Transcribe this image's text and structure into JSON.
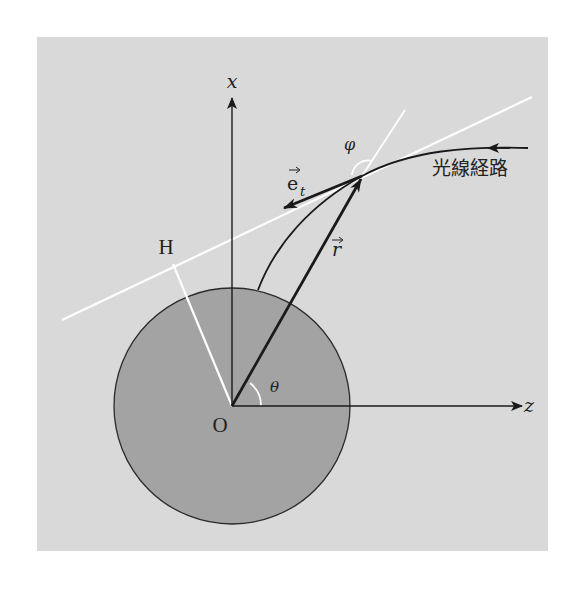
{
  "diagram": {
    "title": "",
    "colors": {
      "panel_background": "#d9d9d9",
      "sphere_fill": "#a3a3a3",
      "ink": "#1a1a1a",
      "construction_lines": "#ffffff"
    },
    "labels": {
      "x_axis": "x",
      "z_axis": "z",
      "origin": "O",
      "foot_point": "H",
      "tangent_vector": "e",
      "tangent_vector_subscript": "t",
      "position_vector": "r",
      "polar_angle": "θ",
      "angle_phi": "φ",
      "light_path": "光線経路"
    },
    "elements": [
      {
        "id": "sphere",
        "type": "circle",
        "description": "gray body centered at O"
      },
      {
        "id": "x-axis",
        "type": "arrow",
        "from": "O",
        "direction": "up"
      },
      {
        "id": "z-axis",
        "type": "arrow",
        "from": "O",
        "direction": "right"
      },
      {
        "id": "light-ray",
        "type": "curve",
        "description": "incoming from right, bending toward sphere"
      },
      {
        "id": "tangent-line",
        "type": "line",
        "color": "white",
        "description": "tangent to ray at point P"
      },
      {
        "id": "perpendicular-OH",
        "type": "line",
        "color": "white",
        "description": "from O perpendicular to tangent line at H"
      },
      {
        "id": "radial-extension",
        "type": "line",
        "color": "white",
        "description": "extension of r beyond P"
      },
      {
        "id": "r-vector",
        "type": "arrow",
        "from": "O",
        "to": "P"
      },
      {
        "id": "et-vector",
        "type": "arrow",
        "from": "P",
        "direction": "along tangent toward sphere"
      },
      {
        "id": "theta-arc",
        "type": "arc",
        "at": "O"
      },
      {
        "id": "phi-arc",
        "type": "arc",
        "at": "P"
      }
    ]
  }
}
